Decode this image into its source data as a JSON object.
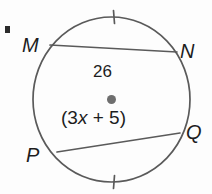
{
  "figure": {
    "type": "circle-geometry-diagram",
    "background_color": "#fdfdfd",
    "stroke_color": "#5a5a5a",
    "text_color": "#1d1d1d",
    "center_dot_color": "#6e6e6e",
    "corner_mark": "·"
  },
  "circle": {
    "center_x": 111.5,
    "center_y": 99.5,
    "radius_x": 78.5,
    "radius_y": 82.5,
    "center_dot_radius": 4.5
  },
  "vertices": [
    {
      "id": "M",
      "label": "M",
      "x": 50,
      "y": 45
    },
    {
      "id": "N",
      "label": "N",
      "x": 177,
      "y": 52
    },
    {
      "id": "Q",
      "label": "Q",
      "x": 180,
      "y": 133
    },
    {
      "id": "P",
      "label": "P",
      "x": 57,
      "y": 152
    }
  ],
  "chords": [
    {
      "id": "MN",
      "from": "M",
      "to": "N",
      "x1": 50,
      "y1": 45,
      "x2": 177,
      "y2": 52,
      "measure_label": "26"
    },
    {
      "id": "PQ",
      "from": "P",
      "to": "Q",
      "x1": 57,
      "y1": 152,
      "x2": 180,
      "y2": 133,
      "measure_label": "(3x + 5)"
    }
  ],
  "labels": {
    "chord_mn_value": "26",
    "expression_open": "(3",
    "expression_var": "x",
    "expression_rest": " + 5)"
  },
  "tick_marks": [
    {
      "id": "top-arc-tick",
      "arc": "MN-major-arc",
      "x": 114,
      "y": 17,
      "length": 13,
      "angle_deg": 4
    },
    {
      "id": "bottom-arc-tick",
      "arc": "PQ-minor-arc",
      "x": 114,
      "y": 182,
      "length": 13,
      "angle_deg": -4
    }
  ]
}
